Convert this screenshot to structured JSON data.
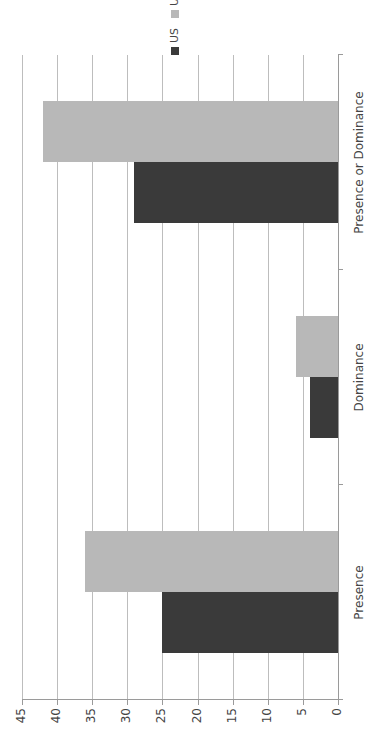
{
  "chart_data": {
    "type": "bar",
    "orientation": "rotated -90deg (vertical bar chart rendered sideways)",
    "title": "",
    "xlabel": "",
    "ylabel": "",
    "categories": [
      "Presence",
      "Dominance",
      "Presence or Dominance"
    ],
    "series": [
      {
        "name": "US",
        "color": "#3a3a3a",
        "values": [
          25,
          4,
          29
        ]
      },
      {
        "name": "UK",
        "color": "#b8b8b8",
        "values": [
          36,
          6,
          42
        ]
      }
    ],
    "ylim": [
      0,
      45
    ],
    "yticks": [
      0,
      5,
      10,
      15,
      20,
      25,
      30,
      35,
      40,
      45
    ],
    "grid": true,
    "legend_position": "top-right"
  },
  "legend": {
    "items": [
      {
        "label": "US",
        "color": "#3a3a3a"
      },
      {
        "label": "UK",
        "color": "#b8b8b8"
      }
    ]
  },
  "axis": {
    "ticks": [
      "0",
      "5",
      "10",
      "15",
      "20",
      "25",
      "30",
      "35",
      "40",
      "45"
    ]
  },
  "categories": [
    "Presence",
    "Dominance",
    "Presence or Dominance"
  ]
}
